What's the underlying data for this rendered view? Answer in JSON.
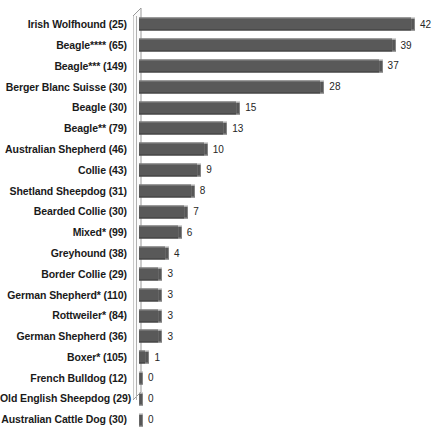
{
  "chart_data": {
    "type": "bar",
    "orientation": "horizontal",
    "title": "",
    "xlabel": "",
    "ylabel": "",
    "xlim": [
      0,
      42
    ],
    "grid": false,
    "legend": false,
    "data_labels": true,
    "bar_color": "#595959",
    "label_color": "#1a1a1a",
    "value_color": "#262626",
    "background": "#ffffff",
    "categories": [
      "Irish Wolfhound (25)",
      "Beagle**** (65)",
      "Beagle*** (149)",
      "Berger Blanc Suisse (30)",
      "Beagle (30)",
      "Beagle** (79)",
      "Australian Shepherd (46)",
      "Collie (43)",
      "Shetland Sheepdog (31)",
      "Bearded Collie (30)",
      "Mixed* (99)",
      "Greyhound (38)",
      "Border Collie (29)",
      "German Shepherd* (110)",
      "Rottweiler* (84)",
      "German Shepherd (36)",
      "Boxer* (105)",
      "French Bulldog (12)",
      "Old English Sheepdog (29)",
      "Australian Cattle Dog (30)"
    ],
    "values": [
      42,
      39,
      37,
      28,
      15,
      13,
      10,
      9,
      8,
      7,
      6,
      4,
      3,
      3,
      3,
      3,
      1,
      0,
      0,
      0
    ],
    "value_labels": [
      "42",
      "39",
      "37",
      "28",
      "15",
      "13",
      "10",
      "9",
      "8",
      "7",
      "6",
      "4",
      "3",
      "3",
      "3",
      "3",
      "1",
      "0",
      "0",
      "0"
    ]
  }
}
